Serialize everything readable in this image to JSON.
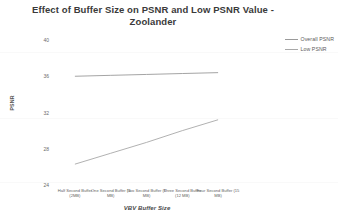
{
  "chart_data": {
    "type": "line",
    "title": "Effect of Buffer Size on PSNR and Low PSNR Value - Zoolander",
    "title_line1": "Effect of Buffer Size on PSNR and Low PSNR Value -",
    "title_line2": "Zoolander",
    "xlabel": "VBV Buffer Size",
    "ylabel": "PSNR",
    "ylim": [
      24,
      40
    ],
    "yticks": [
      "40",
      "36",
      "32",
      "28",
      "24"
    ],
    "ytick_values": [
      40,
      36,
      32,
      28,
      24
    ],
    "grid": false,
    "legend_position": "top-right",
    "categories": [
      "Half Second Buffer (2MB)",
      "One Second Buffer (4 MB)",
      "Two Second Buffer (6 MB)",
      "Three Second Buffer (12 MB)",
      "Four Second Buffer (15 MB)"
    ],
    "categories_split": [
      {
        "l1": "Half Second Buffer",
        "l2": "(2MB)"
      },
      {
        "l1": "One Second Buffer (4",
        "l2": "MB)"
      },
      {
        "l1": "Two Second Buffer (6",
        "l2": "MB)"
      },
      {
        "l1": "Three Second Buffer",
        "l2": "(12 MB)"
      },
      {
        "l1": "Four Second Buffer (15",
        "l2": "MB)"
      }
    ],
    "series": [
      {
        "name": "Overall PSNR",
        "color": "#9a9a9a",
        "values": [
          36.0,
          36.1,
          36.2,
          36.3,
          36.4
        ]
      },
      {
        "name": "Low PSNR",
        "color": "#a8a8a8",
        "values": [
          26.3,
          27.5,
          28.7,
          30.0,
          31.2
        ]
      }
    ]
  },
  "legend": {
    "items": [
      {
        "label": "Overall PSNR"
      },
      {
        "label": "Low PSNR"
      }
    ]
  }
}
